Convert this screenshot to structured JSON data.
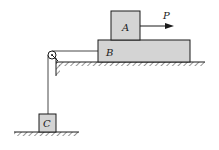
{
  "diagram": {
    "type": "mechanics-pulley-blocks",
    "colors": {
      "block_fill": "#d4d4d4",
      "stroke": "#1a1a1a",
      "background": "#ffffff"
    },
    "blocks": [
      {
        "id": "A",
        "label": "A",
        "x": 111,
        "y": 11,
        "w": 29,
        "h": 29
      },
      {
        "id": "B",
        "label": "B",
        "x": 98,
        "y": 40,
        "w": 92,
        "h": 22
      },
      {
        "id": "C",
        "label": "C",
        "x": 39,
        "y": 114,
        "w": 17,
        "h": 18
      }
    ],
    "force": {
      "label": "P",
      "from_x": 140,
      "to_x": 174,
      "y": 26
    },
    "pulley": {
      "cx": 52,
      "cy": 55,
      "r": 4
    },
    "surfaces": [
      {
        "name": "upper-ground",
        "x1": 56,
        "x2": 205,
        "y": 62
      },
      {
        "name": "lower-ground",
        "x1": 14,
        "x2": 79,
        "y": 132
      }
    ]
  }
}
